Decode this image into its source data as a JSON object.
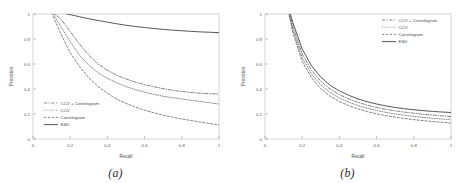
{
  "figure": {
    "panels": [
      {
        "caption": "(a)",
        "xlabel": "Recall",
        "ylabel": "Precision",
        "xticks": [
          "0",
          "0.2",
          "0.4",
          "0.6",
          "0.8",
          "1"
        ],
        "yticks": [
          "0",
          "0.2",
          "0.4",
          "0.6",
          "0.8",
          "1"
        ],
        "legend": [
          {
            "label": "CCV + Correlogram",
            "style": "dashdot"
          },
          {
            "label": "CCV",
            "style": "dotted"
          },
          {
            "label": "Correlogram",
            "style": "dashed"
          },
          {
            "label": "ESD",
            "style": "solid"
          }
        ]
      },
      {
        "caption": "(b)",
        "xlabel": "Recall",
        "ylabel": "Precision",
        "xticks": [
          "0",
          "0.2",
          "0.4",
          "0.6",
          "0.8",
          "1"
        ],
        "yticks": [
          "0",
          "0.2",
          "0.4",
          "0.6",
          "0.8",
          "1"
        ],
        "legend": [
          {
            "label": "CCV + Correlogram",
            "style": "dashdot"
          },
          {
            "label": "CCV",
            "style": "dotted"
          },
          {
            "label": "Correlogram",
            "style": "dashed"
          },
          {
            "label": "ESD",
            "style": "solid"
          }
        ]
      }
    ]
  },
  "chart_data": [
    {
      "type": "line",
      "title": "(a)",
      "xlabel": "Recall",
      "ylabel": "Precision",
      "xlim": [
        0,
        1
      ],
      "ylim": [
        0,
        1
      ],
      "xticks": [
        0,
        0.2,
        0.4,
        0.6,
        0.8,
        1
      ],
      "yticks": [
        0,
        0.2,
        0.4,
        0.6,
        0.8,
        1
      ],
      "grid": false,
      "legend_position": "lower-left",
      "x": [
        0.1,
        0.15,
        0.2,
        0.25,
        0.3,
        0.35,
        0.4,
        0.45,
        0.5,
        0.55,
        0.6,
        0.65,
        0.7,
        0.75,
        0.8,
        0.85,
        0.9,
        0.95,
        1.0
      ],
      "series": [
        {
          "name": "ESD",
          "style": "solid",
          "values": [
            1.02,
            1.01,
            0.995,
            0.978,
            0.962,
            0.948,
            0.935,
            0.922,
            0.91,
            0.9,
            0.892,
            0.884,
            0.877,
            0.871,
            0.866,
            0.861,
            0.857,
            0.854,
            0.851
          ]
        },
        {
          "name": "CCV + Correlogram",
          "style": "dashdot",
          "values": [
            1.02,
            0.96,
            0.86,
            0.76,
            0.67,
            0.6,
            0.55,
            0.51,
            0.48,
            0.455,
            0.435,
            0.418,
            0.403,
            0.39,
            0.38,
            0.372,
            0.366,
            0.362,
            0.36
          ]
        },
        {
          "name": "CCV",
          "style": "dotted",
          "values": [
            1.02,
            0.9,
            0.78,
            0.67,
            0.59,
            0.53,
            0.485,
            0.45,
            0.42,
            0.395,
            0.375,
            0.357,
            0.342,
            0.33,
            0.32,
            0.31,
            0.3,
            0.29,
            0.28
          ]
        },
        {
          "name": "Correlogram",
          "style": "dashed",
          "values": [
            1.01,
            0.84,
            0.69,
            0.58,
            0.49,
            0.42,
            0.365,
            0.32,
            0.285,
            0.255,
            0.23,
            0.21,
            0.19,
            0.175,
            0.16,
            0.148,
            0.135,
            0.124,
            0.113
          ]
        }
      ]
    },
    {
      "type": "line",
      "title": "(b)",
      "xlabel": "Recall",
      "ylabel": "Precision",
      "xlim": [
        0,
        1
      ],
      "ylim": [
        0,
        1
      ],
      "xticks": [
        0,
        0.2,
        0.4,
        0.6,
        0.8,
        1
      ],
      "yticks": [
        0,
        0.2,
        0.4,
        0.6,
        0.8,
        1
      ],
      "grid": false,
      "legend_position": "upper-right",
      "x": [
        0.13,
        0.15,
        0.2,
        0.25,
        0.3,
        0.35,
        0.4,
        0.45,
        0.5,
        0.55,
        0.6,
        0.65,
        0.7,
        0.75,
        0.8,
        0.85,
        0.9,
        0.95,
        1.0
      ],
      "series": [
        {
          "name": "ESD",
          "style": "solid",
          "values": [
            1.03,
            0.93,
            0.72,
            0.585,
            0.495,
            0.43,
            0.385,
            0.35,
            0.32,
            0.298,
            0.28,
            0.265,
            0.252,
            0.242,
            0.234,
            0.227,
            0.221,
            0.216,
            0.212
          ]
        },
        {
          "name": "CCV + Correlogram",
          "style": "dashdot",
          "values": [
            1.02,
            0.9,
            0.68,
            0.55,
            0.462,
            0.4,
            0.355,
            0.32,
            0.293,
            0.27,
            0.252,
            0.237,
            0.225,
            0.215,
            0.206,
            0.198,
            0.192,
            0.186,
            0.18
          ]
        },
        {
          "name": "CCV",
          "style": "dotted",
          "values": [
            1.0,
            0.87,
            0.65,
            0.52,
            0.432,
            0.372,
            0.328,
            0.295,
            0.268,
            0.246,
            0.228,
            0.213,
            0.2,
            0.19,
            0.181,
            0.173,
            0.166,
            0.16,
            0.155
          ]
        },
        {
          "name": "Correlogram",
          "style": "dashed",
          "values": [
            0.99,
            0.85,
            0.62,
            0.49,
            0.402,
            0.342,
            0.3,
            0.267,
            0.24,
            0.219,
            0.202,
            0.187,
            0.175,
            0.164,
            0.155,
            0.147,
            0.14,
            0.134,
            0.128
          ]
        }
      ]
    }
  ]
}
